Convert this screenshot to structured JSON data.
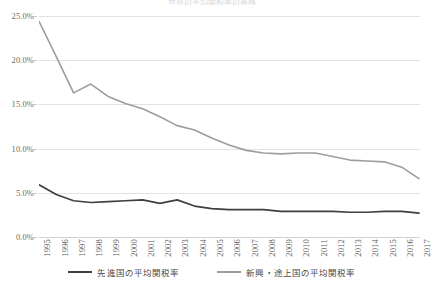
{
  "chart_data": {
    "type": "line",
    "title": "世界の平均関税率の推移",
    "xlabel": "",
    "ylabel": "",
    "x": [
      1995,
      1996,
      1997,
      1998,
      1999,
      2000,
      2001,
      2002,
      2003,
      2004,
      2005,
      2006,
      2007,
      2008,
      2009,
      2010,
      2011,
      2012,
      2013,
      2014,
      2015,
      2016,
      2017
    ],
    "categories": [
      "1995",
      "1996",
      "1997",
      "1998",
      "1999",
      "2000",
      "2001",
      "2002",
      "2003",
      "2004",
      "2005",
      "2006",
      "2007",
      "2008",
      "2009",
      "2010",
      "2011",
      "2012",
      "2013",
      "2014",
      "2015",
      "2016",
      "2017"
    ],
    "series": [
      {
        "name": "先進国の平均関税率",
        "color": "#3f3f3f",
        "values": [
          5.9,
          4.8,
          4.1,
          3.9,
          4.0,
          4.1,
          4.2,
          3.8,
          4.2,
          3.5,
          3.2,
          3.1,
          3.1,
          3.1,
          2.9,
          2.9,
          2.9,
          2.9,
          2.8,
          2.8,
          2.9,
          2.9,
          2.7
        ]
      },
      {
        "name": "新興・途上国の平均関税率",
        "color": "#9d9d9d",
        "values": [
          24.4,
          20.4,
          16.3,
          17.3,
          15.9,
          15.1,
          14.5,
          13.6,
          12.6,
          12.1,
          11.2,
          10.4,
          9.8,
          9.5,
          9.4,
          9.5,
          9.5,
          9.1,
          8.7,
          8.6,
          8.5,
          7.9,
          6.6
        ]
      }
    ],
    "ylim": [
      0,
      25
    ],
    "yticks": [
      0,
      5,
      10,
      15,
      20,
      25
    ],
    "ytick_labels": [
      "0.0%",
      "5.0%",
      "10.0%",
      "15.0%",
      "20.0%",
      "25.0%"
    ],
    "grid": true,
    "legend_position": "bottom",
    "annotations": []
  },
  "legend": {
    "items": [
      {
        "label": "先進国の平均関税率"
      },
      {
        "label": "新興・途上国の平均関税率"
      }
    ]
  }
}
